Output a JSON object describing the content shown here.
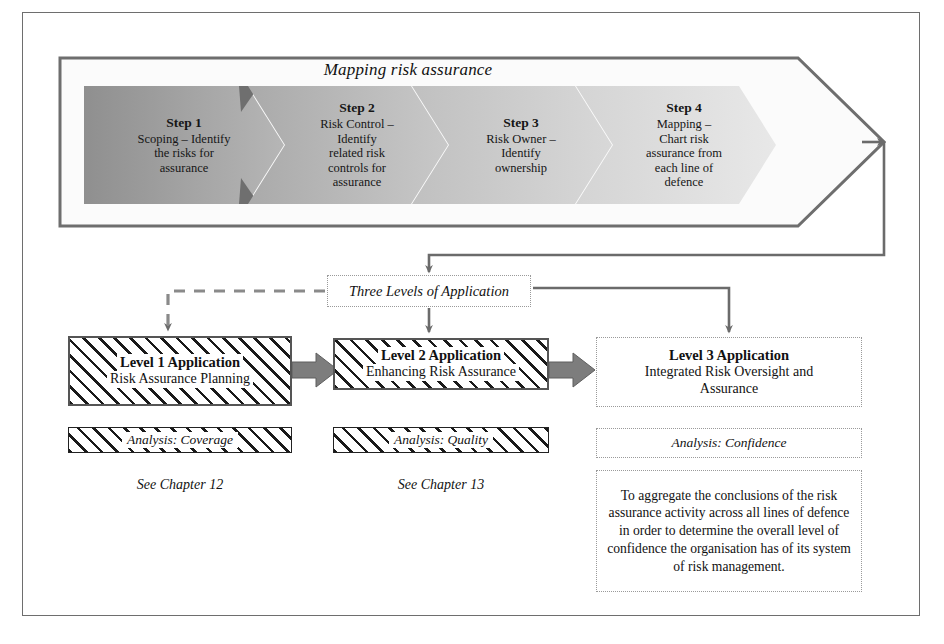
{
  "figure": {
    "title": "Mapping risk assurance",
    "frame_color": "#6e6e6e",
    "arrow_color": "#6b6b6b",
    "block_arrow_color": "#808080"
  },
  "steps": [
    {
      "id": "step-1",
      "title": "Step 1",
      "lines": [
        "Scoping – Identify",
        "the risks for",
        "assurance"
      ],
      "fill": "#9a9a9a"
    },
    {
      "id": "step-2",
      "title": "Step 2",
      "lines": [
        "Risk Control –",
        "Identify",
        "related  risk",
        "controls for",
        "assurance"
      ],
      "fill": "#b4b4b4"
    },
    {
      "id": "step-3",
      "title": "Step  3",
      "lines": [
        "Risk Owner –",
        "Identify",
        "ownership"
      ],
      "fill": "#c9c9c9"
    },
    {
      "id": "step-4",
      "title": "Step  4",
      "lines": [
        "Mapping –",
        "Chart risk",
        "assurance from",
        "each line of",
        "defence"
      ],
      "fill": "#dcdcdc"
    }
  ],
  "three_levels": {
    "label": "Three Levels of Application"
  },
  "levels": [
    {
      "id": "level-1",
      "title": "Level 1 Application",
      "subtitle": "Risk Assurance Planning",
      "analysis": "Analysis: Coverage",
      "chapter": "See Chapter 12",
      "style": "hatched"
    },
    {
      "id": "level-2",
      "title": "Level 2 Application",
      "subtitle": "Enhancing Risk Assurance",
      "analysis": "Analysis: Quality",
      "chapter": "See Chapter 13",
      "style": "hatched"
    },
    {
      "id": "level-3",
      "title": "Level 3 Application",
      "subtitle": "Integrated Risk Oversight and Assurance",
      "analysis": "Analysis: Confidence",
      "body": "To aggregate the conclusions of the risk assurance activity across all lines of defence in order to determine the overall level of confidence the organisation  has of its system of risk management.",
      "style": "dotted"
    }
  ]
}
